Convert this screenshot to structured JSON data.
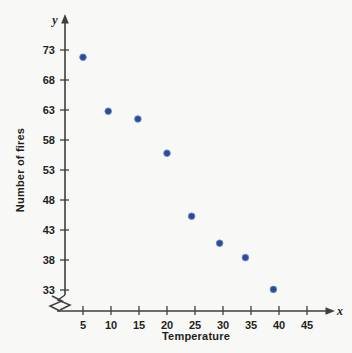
{
  "chart_data": {
    "type": "scatter",
    "title": "",
    "xlabel": "Temperature",
    "ylabel": "Number of fires",
    "x_axis_symbol": "x",
    "y_axis_symbol": "y",
    "xlim": [
      0,
      47
    ],
    "ylim": [
      31,
      75.5
    ],
    "xticks": [
      5,
      10,
      15,
      20,
      25,
      30,
      35,
      40,
      45
    ],
    "yticks": [
      33,
      38,
      43,
      48,
      53,
      58,
      63,
      68,
      73
    ],
    "xtick_labels": [
      "5",
      "10",
      "15",
      "20",
      "25",
      "30",
      "35",
      "40",
      "45"
    ],
    "ytick_labels": [
      "33",
      "38",
      "43",
      "48",
      "53",
      "58",
      "63",
      "68",
      "73"
    ],
    "grid": false,
    "legend": null,
    "axis_break_x": true,
    "axis_break_y": true,
    "marker_color": "#2a4b9b",
    "axis_color": "#3f3f3f",
    "background_color": "#f8f8f6",
    "points": [
      {
        "x": 5.0,
        "y": 71.8
      },
      {
        "x": 9.5,
        "y": 62.8
      },
      {
        "x": 14.8,
        "y": 61.5
      },
      {
        "x": 20.0,
        "y": 55.8
      },
      {
        "x": 24.4,
        "y": 45.3
      },
      {
        "x": 29.4,
        "y": 40.8
      },
      {
        "x": 34.0,
        "y": 38.4
      },
      {
        "x": 39.0,
        "y": 33.1
      }
    ]
  }
}
